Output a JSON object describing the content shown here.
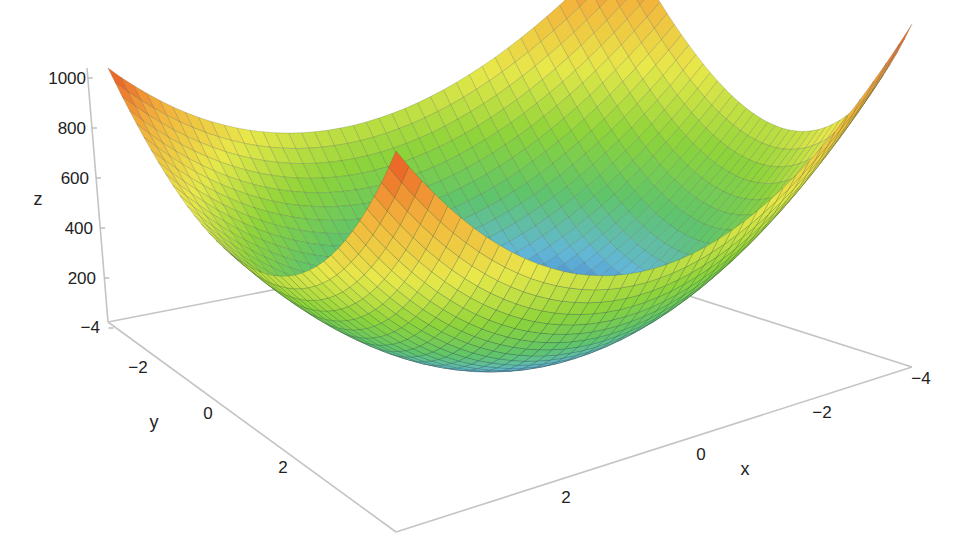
{
  "chart_data": {
    "type": "surface3d",
    "title": "",
    "function": "z = 30*(x^2 + y^2) + 2.2*(x^4+y^4) approx paraboloid bowl, minimum near 0 at (0,0), ~1000 at corners",
    "x": {
      "label": "x",
      "range": [
        -4,
        4
      ],
      "ticks": [
        "-4",
        "-2",
        "0",
        "2"
      ]
    },
    "y": {
      "label": "y",
      "range": [
        -4,
        4
      ],
      "ticks": [
        "-4",
        "-2",
        "0",
        "2"
      ]
    },
    "z": {
      "label": "z",
      "range": [
        0,
        1000
      ],
      "ticks": [
        "1000",
        "800",
        "600",
        "400",
        "200"
      ]
    },
    "grid_resolution": 41,
    "colormap": [
      "#2f3aa0",
      "#3f6fc8",
      "#62b8d8",
      "#5fc46a",
      "#8ed43a",
      "#e8e84a",
      "#f3b23c",
      "#e8451f"
    ],
    "sample_values": [
      {
        "x": -4,
        "y": -4,
        "z": 1000
      },
      {
        "x": 4,
        "y": -4,
        "z": 1000
      },
      {
        "x": -4,
        "y": 4,
        "z": 1000
      },
      {
        "x": 4,
        "y": 4,
        "z": 1000
      },
      {
        "x": 0,
        "y": 0,
        "z": 0
      },
      {
        "x": 0,
        "y": -4,
        "z": 500
      },
      {
        "x": -4,
        "y": 0,
        "z": 500
      }
    ],
    "grid": false,
    "legend": "none"
  },
  "axes": {
    "z_title": "z",
    "y_title": "y",
    "x_title": "x",
    "z_ticks": [
      {
        "label": "1000",
        "x": 86,
        "y": 78
      },
      {
        "label": "800",
        "x": 86,
        "y": 128
      },
      {
        "label": "600",
        "x": 86,
        "y": 178
      },
      {
        "label": "400",
        "x": 86,
        "y": 228
      },
      {
        "label": "200",
        "x": 86,
        "y": 278
      },
      {
        "label": "−4",
        "x": 86,
        "y": 328
      }
    ],
    "y_ticks": [
      {
        "label": "−2",
        "x": 140,
        "y": 372
      },
      {
        "label": "0",
        "x": 208,
        "y": 418
      },
      {
        "label": "2",
        "x": 284,
        "y": 472
      }
    ],
    "x_ticks": [
      {
        "label": "−4",
        "x": 922,
        "y": 383
      },
      {
        "label": "−2",
        "x": 823,
        "y": 418
      },
      {
        "label": "0",
        "x": 702,
        "y": 460
      },
      {
        "label": "2",
        "x": 565,
        "y": 502
      }
    ],
    "titles_pos": {
      "z": {
        "x": 38,
        "y": 205
      },
      "y": {
        "x": 154,
        "y": 430
      },
      "x": {
        "x": 744,
        "y": 476
      }
    }
  }
}
